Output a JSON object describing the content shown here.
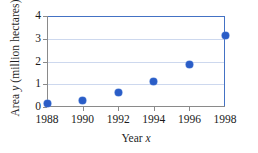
{
  "chart_data": {
    "type": "scatter",
    "title": "",
    "xlabel": "Year x",
    "ylabel": "Area y  (million hectares)",
    "ylabel_prefix": "Area ",
    "ylabel_var": "y",
    "ylabel_suffix": "  (million hectares)",
    "xlabel_prefix": "Year ",
    "xlabel_var": "x",
    "x": [
      1988,
      1990,
      1992,
      1994,
      1996,
      1998
    ],
    "values": [
      0.15,
      0.3,
      0.65,
      1.1,
      1.85,
      3.15
    ],
    "xtick_labels": [
      "1988",
      "1990",
      "1992",
      "1994",
      "1996",
      "1998"
    ],
    "ytick_labels": [
      "0",
      "1",
      "2",
      "3",
      "4"
    ],
    "ytick_values": [
      0,
      1,
      2,
      3,
      4
    ],
    "xlim": [
      1988,
      1998
    ],
    "ylim": [
      0,
      4
    ],
    "grid": "horizontal",
    "legend": "none",
    "marker_color": "#2a5dc7",
    "frame_color": "#4472c4",
    "axis_color": "#8a8a8a",
    "grid_color": "#cdd8ee",
    "points": [
      {
        "x": 1988,
        "y": 0.15
      },
      {
        "x": 1990,
        "y": 0.3
      },
      {
        "x": 1992,
        "y": 0.65
      },
      {
        "x": 1994,
        "y": 1.1
      },
      {
        "x": 1996,
        "y": 1.85
      },
      {
        "x": 1998,
        "y": 3.15
      }
    ]
  }
}
